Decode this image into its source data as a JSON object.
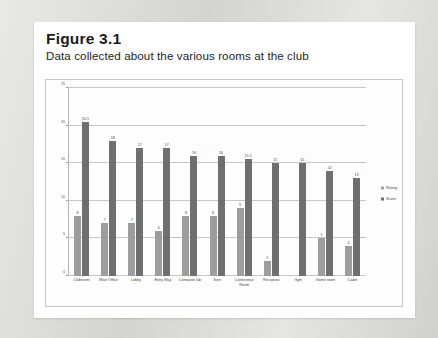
{
  "figure": {
    "number": "Figure 3.1",
    "caption": "Data collected about the various rooms at the club"
  },
  "legend": {
    "position": "right",
    "items": [
      {
        "label": "Rating",
        "color": "#9d9d9d"
      },
      {
        "label": "Score",
        "color": "#6f6f6f"
      }
    ]
  },
  "axis": {
    "y_ticks": [
      "0",
      "5",
      "10",
      "15",
      "20",
      "25"
    ]
  },
  "chart_data": {
    "type": "bar",
    "title": "Data collected about the various rooms at the club",
    "xlabel": "",
    "ylabel": "",
    "ylim": [
      0,
      25
    ],
    "grid": true,
    "legend_position": "right",
    "categories": [
      "Clubroom",
      "Main Office",
      "Lobby",
      "Entry Way",
      "Computer lab",
      "Teen",
      "Conference Room",
      "Reception",
      "Gym",
      "Game room",
      "Cadet"
    ],
    "series": [
      {
        "name": "Rating",
        "color": "#9d9d9d",
        "values": [
          8,
          7,
          7,
          6,
          8,
          8,
          9,
          2,
          0,
          5,
          4
        ],
        "labels": [
          "8",
          "7",
          "7",
          "6",
          "8",
          "8",
          "9",
          "2",
          "",
          "5",
          "4"
        ]
      },
      {
        "name": "Score",
        "color": "#6f6f6f",
        "values": [
          20.5,
          18,
          17,
          17,
          16,
          16,
          15.5,
          15,
          15,
          14,
          13
        ],
        "labels": [
          "20.5",
          "18",
          "17",
          "17",
          "16",
          "16",
          "15.5",
          "15",
          "15",
          "14",
          "13"
        ]
      }
    ]
  }
}
